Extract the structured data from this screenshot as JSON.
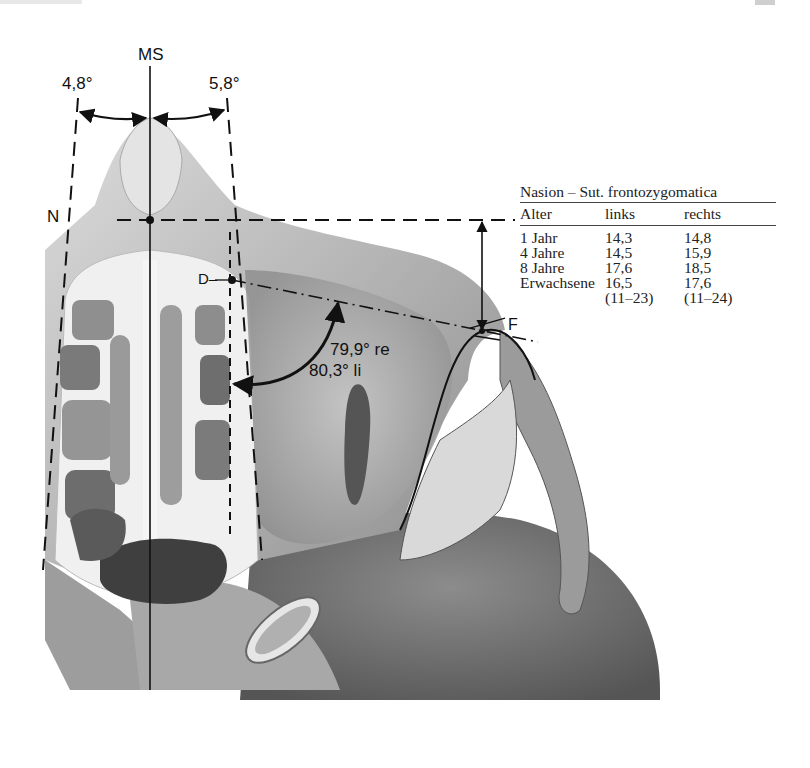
{
  "figure": {
    "labels": {
      "midsagittal": "MS",
      "angle_left": "4,8°",
      "angle_right": "5,8°",
      "point_n": "N",
      "point_d": "D–",
      "point_f": "F",
      "angle_right_side": "79,9° re",
      "angle_left_side": "80,3° li"
    }
  },
  "table": {
    "title": "Nasion – Sut. frontozygomatica",
    "columns": [
      "Alter",
      "links",
      "rechts"
    ],
    "rows": [
      {
        "age": "1 Jahr",
        "left": "14,3",
        "right": "14,8"
      },
      {
        "age": "4 Jahre",
        "left": "14,5",
        "right": "15,9"
      },
      {
        "age": "8 Jahre",
        "left": "17,6",
        "right": "18,5"
      },
      {
        "age": "Erwachsene",
        "left": "16,5",
        "right": "17,6"
      },
      {
        "age": "",
        "left": "(11–23)",
        "right": "(11–24)"
      }
    ]
  },
  "colors": {
    "line": "#111111",
    "bone_light": "#e9e9e9",
    "bone_mid": "#a9a9a9",
    "bone_dark": "#4a4a4a",
    "background": "#ffffff"
  }
}
